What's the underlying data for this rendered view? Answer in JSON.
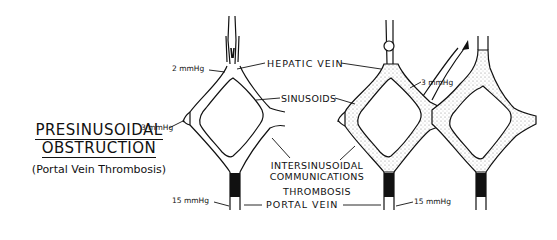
{
  "title": {
    "line1": "PRESINUSOIDAL",
    "line2": "OBSTRUCTION",
    "subtitle": "(Portal Vein Thrombosis)"
  },
  "labels": {
    "hepatic_vein": "HEPATIC VEIN",
    "sinusoids": "SINUSOIDS",
    "intersinusoidal_line1": "INTERSINUSOIDAL",
    "intersinusoidal_line2": "COMMUNICATIONS",
    "thrombosis": "THROMBOSIS",
    "portal_vein": "PORTAL VEIN"
  },
  "pressures": {
    "hepatic_left": "2 mmHg",
    "sinusoid_left": "3 mmHg",
    "portal_left": "15 mmHg",
    "sinusoid_right": "3 mmHg",
    "portal_right": "15 mmHg"
  },
  "colors": {
    "ink": "#111111",
    "stipple": "#9a9a9a",
    "background": "#ffffff"
  }
}
